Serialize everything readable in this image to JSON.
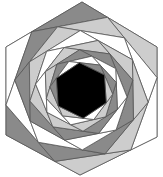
{
  "diagram": {
    "width": 163,
    "height": 177,
    "outer_hexagon": [
      [
        82,
        2
      ],
      [
        157,
        47
      ],
      [
        157,
        137
      ],
      [
        80,
        175
      ],
      [
        6,
        135
      ],
      [
        6,
        47
      ]
    ],
    "edge_fraction": 0.34,
    "layers": 9,
    "center_fill": "#000000",
    "stroke": "#555555",
    "stroke_width": 0.8,
    "colors": {
      "dark": "#8a8a8a",
      "light": "#cdcdcd",
      "white": "#ffffff"
    },
    "triangle_pattern": [
      "dark",
      "light",
      "white",
      "light",
      "dark",
      "white"
    ]
  }
}
